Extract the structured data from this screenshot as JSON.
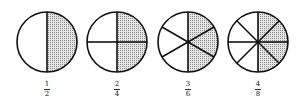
{
  "colors": {
    "stroke": "#111111",
    "shade": "#c8c8c8",
    "background": "#ffffff"
  },
  "circles": [
    {
      "numerator": 1,
      "denominator": 2,
      "label_num": "1",
      "label_den": "2",
      "shaded_fraction": 0.5
    },
    {
      "numerator": 2,
      "denominator": 4,
      "label_num": "2",
      "label_den": "4",
      "shaded_fraction": 0.5
    },
    {
      "numerator": 3,
      "denominator": 6,
      "label_num": "3",
      "label_den": "6",
      "shaded_fraction": 0.5
    },
    {
      "numerator": 4,
      "denominator": 8,
      "label_num": "4",
      "label_den": "8",
      "shaded_fraction": 0.5
    }
  ]
}
